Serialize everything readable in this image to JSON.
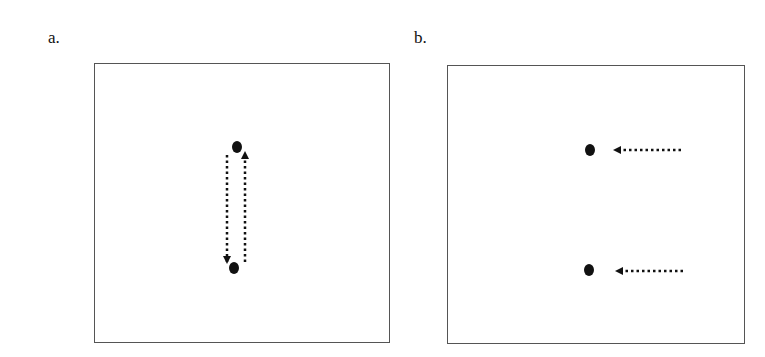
{
  "panels": [
    {
      "label": "a.",
      "description": "Two dots arranged vertically with dotted arrows pointing down and up between them",
      "dots": [
        {
          "x": 237,
          "y": 147
        },
        {
          "x": 234,
          "y": 268
        }
      ],
      "arrows": [
        {
          "from": [
            227,
            155
          ],
          "to": [
            227,
            262
          ],
          "direction": "down"
        },
        {
          "from": [
            245,
            262
          ],
          "to": [
            245,
            153
          ],
          "direction": "up"
        }
      ]
    },
    {
      "label": "b.",
      "description": "Two dots with dotted arrows approaching from the right",
      "dots": [
        {
          "x": 590,
          "y": 150
        },
        {
          "x": 589,
          "y": 270
        }
      ],
      "arrows": [
        {
          "from": [
            681,
            150
          ],
          "to": [
            615,
            150
          ],
          "direction": "left"
        },
        {
          "from": [
            683,
            271
          ],
          "to": [
            617,
            271
          ],
          "direction": "left"
        }
      ]
    }
  ],
  "colors": {
    "ink": "#111111",
    "border": "#555555",
    "background": "#ffffff"
  }
}
